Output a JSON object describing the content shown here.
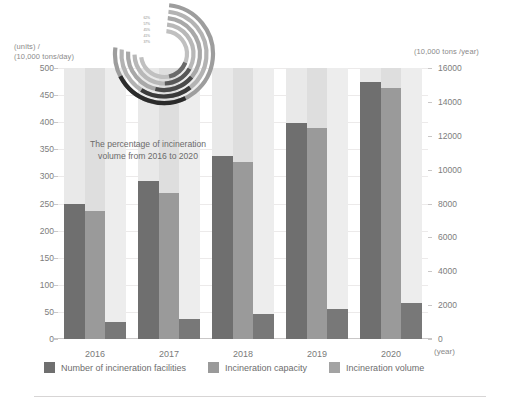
{
  "chart_data": {
    "type": "bar",
    "title": "",
    "subtitle": "",
    "categories": [
      "2016",
      "2017",
      "2018",
      "2019",
      "2020"
    ],
    "xlabel": "(year)",
    "ylabel_left": "(units) /\n(10,000 tons/day)",
    "ylabel_right": "(10,000 tons /year)",
    "ylim_left": [
      0,
      500
    ],
    "ylim_right": [
      0,
      16000
    ],
    "yticks_left": [
      "500",
      "450",
      "400",
      "350",
      "300",
      "250",
      "200",
      "150",
      "100",
      "50",
      "0"
    ],
    "yticks_right": [
      "16000",
      "14000",
      "12000",
      "10000",
      "8000",
      "6000",
      "4000",
      "2000",
      "0"
    ],
    "grid": true,
    "legend_position": "bottom",
    "series": [
      {
        "name": "Number of incineration facilities",
        "axis": "left",
        "color": "#6f6f6f",
        "values": [
          250,
          292,
          337,
          399,
          475
        ]
      },
      {
        "name": "Incineration capacity",
        "axis": "left",
        "color": "#9a9a9a",
        "values": [
          236,
          270,
          326,
          389,
          464
        ]
      },
      {
        "name": "Incineration volume",
        "axis": "right",
        "color": "#787878",
        "values": [
          1000,
          1200,
          1450,
          1800,
          2150
        ]
      }
    ],
    "annotations": [
      {
        "name": "spiral-note",
        "text": "The percentage of incineration volume from 2016 to 2020"
      }
    ]
  },
  "axes": {
    "left_caption_line1": "(units) /",
    "left_caption_line2": "(10,000 tons/day)",
    "right_caption": "(10,000 tons /year)",
    "x_unit": "(year)"
  },
  "annotation": {
    "text": "The percentage of incineration volume from 2016 to 2020"
  },
  "spiral": {
    "labels": [
      "62%",
      "57%",
      "45%",
      "41%",
      "37%"
    ]
  },
  "legend": {
    "items": [
      {
        "label": "Number of incineration facilities",
        "color": "#6f6f6f"
      },
      {
        "label": "Incineration capacity",
        "color": "#9a9a9a"
      },
      {
        "label": "Incineration volume",
        "color": "#a3a3a3"
      }
    ]
  },
  "colors": {
    "facilities": "#6f6f6f",
    "capacity": "#9a9a9a",
    "volume": "#787878",
    "band": "#e9e9e9",
    "grid": "#eceaea",
    "text": "#6e6e6e"
  }
}
